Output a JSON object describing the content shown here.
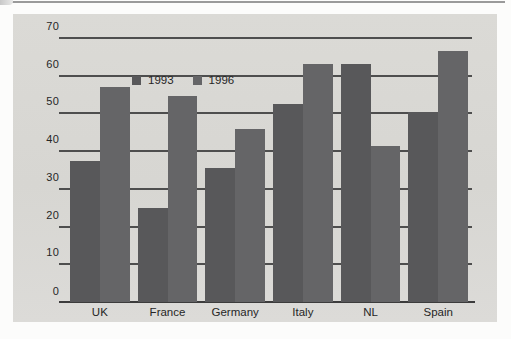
{
  "colors": {
    "page_bg": "#fcfcfb",
    "panel_bg": "#d8d7d3",
    "grid": "#4e4e4e",
    "axis": "#3c3c3c",
    "text": "#262626",
    "top_rule": "#9a9a9a",
    "series": [
      "#58585a",
      "#656567"
    ]
  },
  "legend": {
    "items": [
      {
        "label": "1993",
        "color": "#58585a"
      },
      {
        "label": "1996",
        "color": "#656567"
      }
    ]
  },
  "chart_data": {
    "type": "bar",
    "categories": [
      "UK",
      "France",
      "Germany",
      "Italy",
      "NL",
      "Spain"
    ],
    "series": [
      {
        "name": "1993",
        "values": [
          37.5,
          25,
          35.5,
          52.5,
          63,
          50.5
        ]
      },
      {
        "name": "1996",
        "values": [
          57,
          54.5,
          46,
          63,
          41.5,
          66.5
        ]
      }
    ],
    "title": "",
    "xlabel": "",
    "ylabel": "",
    "ylim": [
      0,
      70
    ],
    "ytick_step": 10,
    "ytick_labels": [
      "0",
      "10",
      "20",
      "30",
      "40",
      "50",
      "60",
      "70"
    ],
    "grid": true,
    "legend_position": "top-left"
  }
}
